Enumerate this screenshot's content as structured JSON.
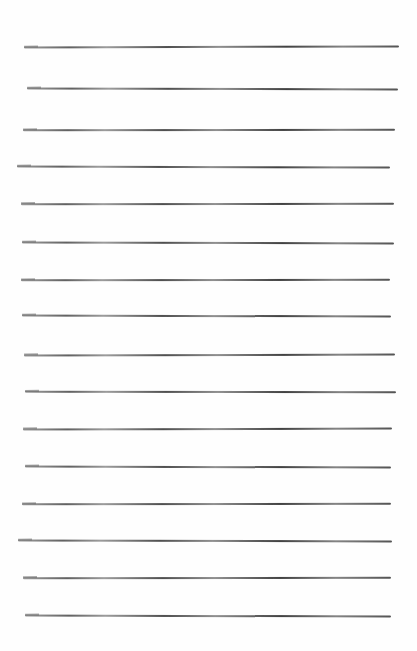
{
  "document": {
    "type": "lined-paper",
    "background_color": "#fefefe",
    "rule_color": "#4a4a4a",
    "rule_count": 16,
    "rules": [
      {
        "y": 46,
        "x1": 24,
        "x2": 399,
        "tilt": 0.6
      },
      {
        "y": 88,
        "x1": 27,
        "x2": 398,
        "tilt": 0.4
      },
      {
        "y": 129,
        "x1": 23,
        "x2": 395,
        "tilt": 0.3
      },
      {
        "y": 166,
        "x1": 17,
        "x2": 390,
        "tilt": 0.5
      },
      {
        "y": 203,
        "x1": 21,
        "x2": 394,
        "tilt": 0.2
      },
      {
        "y": 242,
        "x1": 22,
        "x2": 394,
        "tilt": 0.4
      },
      {
        "y": 279,
        "x1": 21,
        "x2": 390,
        "tilt": 0.3
      },
      {
        "y": 315,
        "x1": 22,
        "x2": 391,
        "tilt": 0.5
      },
      {
        "y": 354,
        "x1": 24,
        "x2": 395,
        "tilt": 0.4
      },
      {
        "y": 391,
        "x1": 25,
        "x2": 396,
        "tilt": 0.2
      },
      {
        "y": 428,
        "x1": 23,
        "x2": 392,
        "tilt": 0.4
      },
      {
        "y": 466,
        "x1": 25,
        "x2": 391,
        "tilt": 0.5
      },
      {
        "y": 503,
        "x1": 22,
        "x2": 391,
        "tilt": 0.3
      },
      {
        "y": 540,
        "x1": 18,
        "x2": 392,
        "tilt": 0.4
      },
      {
        "y": 577,
        "x1": 23,
        "x2": 391,
        "tilt": 0.2
      },
      {
        "y": 615,
        "x1": 25,
        "x2": 391,
        "tilt": 0.5
      }
    ]
  }
}
